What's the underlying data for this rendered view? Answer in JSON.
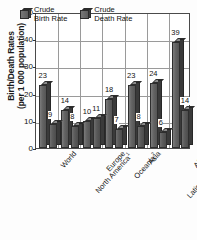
{
  "chart_data": {
    "type": "bar",
    "title": "",
    "xlabel": "",
    "ylabel": "Birth/Death Rates (per 1 000 population)",
    "ylabel_line1": "Birth/Death Rates",
    "ylabel_line2": "(per 1 000 population)",
    "ylim": [
      0,
      50
    ],
    "yticks": [
      0,
      10,
      20,
      30,
      40,
      50
    ],
    "grid": true,
    "legend_position": "top-inside",
    "categories": [
      "World",
      "North America",
      "Europe",
      "Oceania",
      "Asia",
      "Latin America and the Caribbean",
      "Africa"
    ],
    "category_footnotes": [
      "",
      "1",
      "",
      "2",
      "",
      "",
      ""
    ],
    "series": [
      {
        "name": "Crude Birth Rate",
        "values": [
          23,
          14,
          10,
          18,
          23,
          24,
          39
        ]
      },
      {
        "name": "Crude Death Rate",
        "values": [
          9,
          8,
          11,
          7,
          8,
          6,
          14
        ]
      }
    ]
  },
  "legend": {
    "items": [
      {
        "label_line1": "Crude",
        "label_line2": "Birth Rate"
      },
      {
        "label_line1": "Crude",
        "label_line2": "Death Rate"
      }
    ]
  },
  "axis": {
    "ytick_labels": [
      "50",
      "40",
      "30",
      "20",
      "10",
      "0"
    ]
  }
}
